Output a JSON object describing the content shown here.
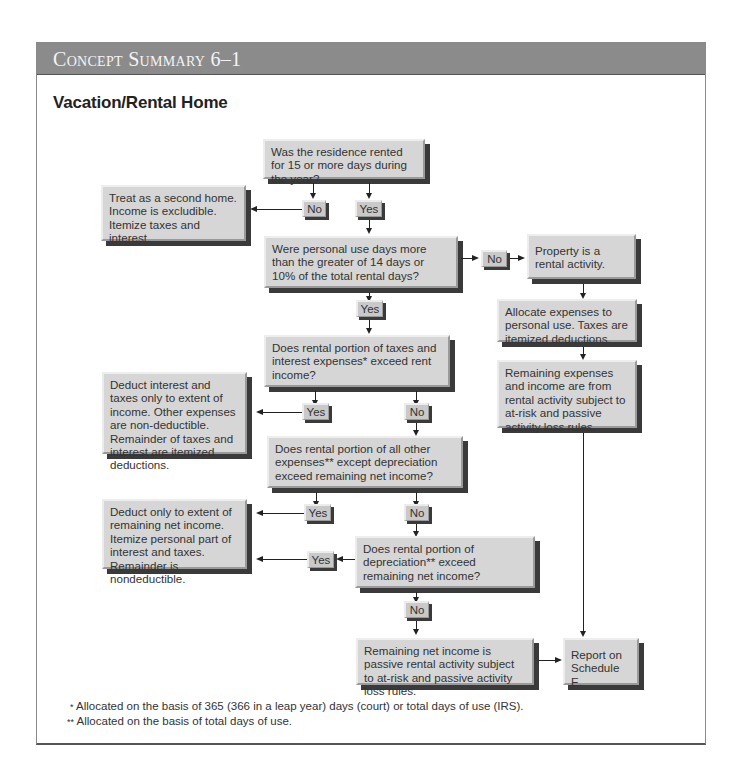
{
  "header": {
    "title": "Concept Summary 6–1"
  },
  "section": {
    "title": "Vacation/Rental Home"
  },
  "flowchart": {
    "q1": "Was the residence rented for 15 or more days during the year?",
    "q1_no": "No",
    "q1_yes": "Yes",
    "second_home": "Treat as a second home. Income is excludible. Itemize taxes and interest.",
    "q2": "Were personal use days more than the greater of 14 days or 10% of the total rental days?",
    "q2_no": "No",
    "q2_yes": "Yes",
    "rental_activity": "Property is a rental activity.",
    "allocate": "Allocate expenses to personal use. Taxes are itemized deductions.",
    "remaining_expenses": "Remaining expenses and income are from rental activity subject to at-risk and passive activity loss rules.",
    "q3": "Does rental portion of taxes and interest expenses* exceed rent income?",
    "q3_yes": "Yes",
    "q3_no": "No",
    "deduct_interest": "Deduct interest and taxes only to extent of income. Other expenses are non-deductible. Remainder of taxes and interest are itemized deductions.",
    "q4": "Does rental portion of all other expenses** except depreciation exceed remaining net income?",
    "q4_yes": "Yes",
    "q4_no": "No",
    "deduct_only": "Deduct only to extent of remaining net income. Itemize personal part of interest and taxes. Remainder is nondeductible.",
    "q5": "Does rental portion of depreciation** exceed remaining net income?",
    "q5_yes": "Yes",
    "q5_no": "No",
    "remaining_net": "Remaining net income is passive rental activity subject to at-risk and passive activity loss rules.",
    "report": "Report on Schedule E."
  },
  "footnotes": [
    {
      "marker": "*",
      "text": "Allocated on the basis of 365 (366 in a leap year) days (court) or total days of use (IRS)."
    },
    {
      "marker": "**",
      "text": "Allocated on the basis of total days of use."
    }
  ]
}
